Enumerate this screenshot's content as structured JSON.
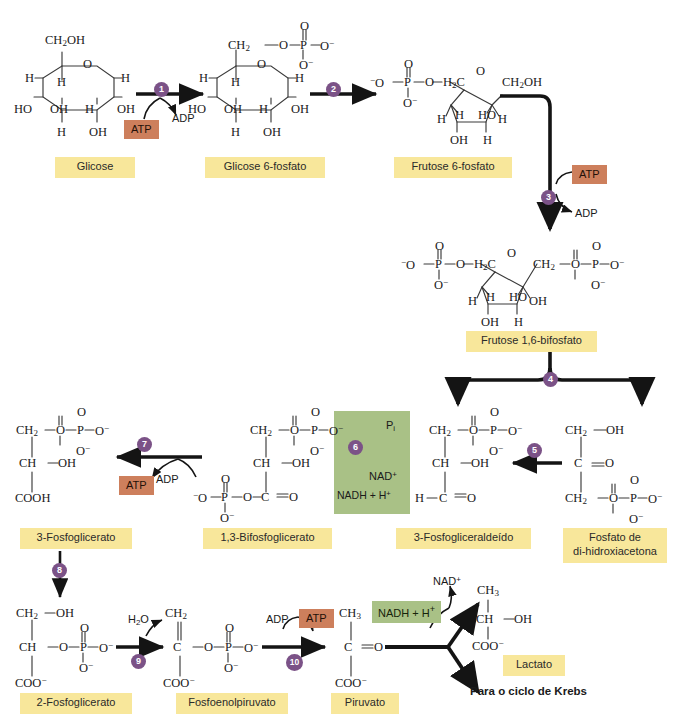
{
  "diagram": {
    "language": "pt-BR",
    "colors": {
      "label_yellow": "#f8e79b",
      "atp_terracotta": "#cd7f5c",
      "cofactor_green": "#a9c186",
      "step_purple": "#7b5287",
      "bond_dark": "#3a3a3a",
      "background": "#ffffff"
    }
  },
  "compounds": {
    "glucose": {
      "label": "Glicose"
    },
    "g6p": {
      "label": "Glicose 6-fosfato"
    },
    "f6p": {
      "label": "Frutose 6-fosfato"
    },
    "fbp": {
      "label": "Frutose 1,6-bifosfato"
    },
    "dhap": {
      "label_line1": "Fosfato de",
      "label_line2": "di-hidroxiacetona"
    },
    "g3p": {
      "label": "3-Fosfogliceraldeído"
    },
    "bpg": {
      "label": "1,3-Bifosfoglicerato"
    },
    "pg3": {
      "label": "3-Fosfoglicerato"
    },
    "pg2": {
      "label": "2-Fosfoglicerato"
    },
    "pep": {
      "label": "Fosfoenolpiruvato"
    },
    "pyruvate": {
      "label": "Piruvato"
    },
    "lactate": {
      "label": "Lactato"
    }
  },
  "steps": [
    {
      "n": "1"
    },
    {
      "n": "2"
    },
    {
      "n": "3"
    },
    {
      "n": "4"
    },
    {
      "n": "5"
    },
    {
      "n": "6"
    },
    {
      "n": "7"
    },
    {
      "n": "8"
    },
    {
      "n": "9"
    },
    {
      "n": "10"
    }
  ],
  "cofactors": {
    "atp": "ATP",
    "adp": "ADP",
    "pi_symbol": "P",
    "pi_sub": "i",
    "nad_plus": "NAD",
    "nadh": "NADH + H",
    "water": "H"
  },
  "outputs": {
    "krebs": "Para o ciclo de Krebs"
  },
  "atoms": {
    "ch2oh": "CH",
    "ch2": "CH",
    "ch3": "CH",
    "h": "H",
    "o": "O",
    "oh": "OH",
    "ho": "HO",
    "p": "P",
    "c": "C",
    "ch": "CH",
    "cooh": "COOH",
    "coo": "COO",
    "h2c": "H",
    "o_minus": "O"
  }
}
